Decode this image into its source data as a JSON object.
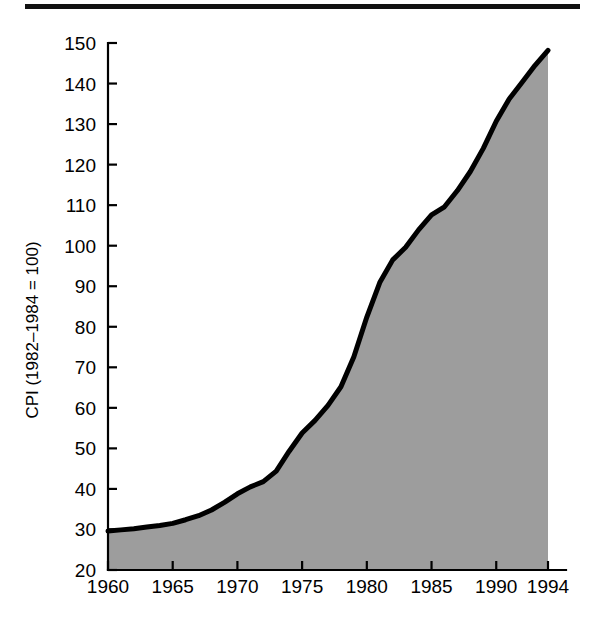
{
  "figure": {
    "top_rule": "horizontal-rule",
    "background_color": "#ffffff"
  },
  "chart_data": {
    "type": "area",
    "title": "",
    "subtitle": "",
    "xlabel": "",
    "ylabel": "CPI (1982–1984 = 100)",
    "xlim": [
      1960,
      1994
    ],
    "ylim": [
      20,
      150
    ],
    "grid": false,
    "legend": null,
    "fill_color": "#9d9d9d",
    "line_color": "#000000",
    "baseline": 20,
    "xticks": [
      1960,
      1965,
      1970,
      1975,
      1980,
      1985,
      1990,
      1994
    ],
    "xtick_labels": [
      "1960",
      "1965",
      "1970",
      "1975",
      "1980",
      "1985",
      "1990",
      "1994"
    ],
    "yticks": [
      20,
      30,
      40,
      50,
      60,
      70,
      80,
      90,
      100,
      110,
      120,
      130,
      140,
      150
    ],
    "ytick_labels": [
      "20",
      "30",
      "40",
      "50",
      "60",
      "70",
      "80",
      "90",
      "100",
      "110",
      "120",
      "130",
      "140",
      "150"
    ],
    "x": [
      1960,
      1961,
      1962,
      1963,
      1964,
      1965,
      1966,
      1967,
      1968,
      1969,
      1970,
      1971,
      1972,
      1973,
      1974,
      1975,
      1976,
      1977,
      1978,
      1979,
      1980,
      1981,
      1982,
      1983,
      1984,
      1985,
      1986,
      1987,
      1988,
      1989,
      1990,
      1991,
      1992,
      1993,
      1994
    ],
    "values": [
      29.6,
      29.9,
      30.2,
      30.6,
      31.0,
      31.5,
      32.4,
      33.4,
      34.8,
      36.7,
      38.8,
      40.5,
      41.8,
      44.4,
      49.3,
      53.8,
      56.9,
      60.6,
      65.2,
      72.6,
      82.4,
      90.9,
      96.5,
      99.6,
      103.9,
      107.6,
      109.6,
      113.6,
      118.3,
      124.0,
      130.7,
      136.2,
      140.3,
      144.5,
      148.2
    ],
    "series_name": "Consumer Price Index",
    "annotations": []
  }
}
